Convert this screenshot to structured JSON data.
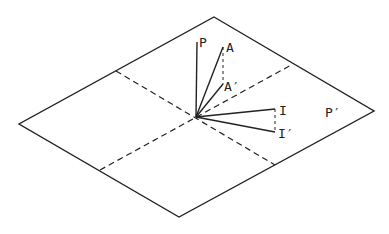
{
  "diagram": {
    "plane_label": "P′",
    "vectors": [
      {
        "id": "P",
        "label": "P"
      },
      {
        "id": "A",
        "label": "A"
      },
      {
        "id": "A_prime",
        "label": "A′"
      },
      {
        "id": "I",
        "label": "I"
      },
      {
        "id": "I_prime",
        "label": "I′"
      }
    ],
    "colors": {
      "ink": "#222222",
      "background": "#ffffff"
    }
  }
}
